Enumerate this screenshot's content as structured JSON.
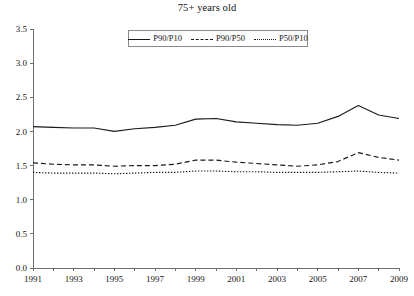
{
  "chart_data": {
    "type": "line",
    "title": "75+ years old",
    "xlabel": "",
    "ylabel": "",
    "xlim": [
      1991,
      2009
    ],
    "ylim": [
      0.0,
      3.5
    ],
    "ytick_labels": [
      "0.0",
      "0.5",
      "1.0",
      "1.5",
      "2.0",
      "2.5",
      "3.0",
      "3.5"
    ],
    "ytick_values": [
      0.0,
      0.5,
      1.0,
      1.5,
      2.0,
      2.5,
      3.0,
      3.5
    ],
    "xtick_labels": [
      "1991",
      "1993",
      "1995",
      "1997",
      "1999",
      "2001",
      "2003",
      "2005",
      "2007",
      "2009"
    ],
    "xtick_values": [
      1991,
      1993,
      1995,
      1997,
      1999,
      2001,
      2003,
      2005,
      2007,
      2009
    ],
    "minor_xtick_values": [
      1992,
      1994,
      1996,
      1998,
      2000,
      2002,
      2004,
      2006,
      2008
    ],
    "grid": false,
    "legend_position": "top-center",
    "x": [
      1991,
      1992,
      1993,
      1994,
      1995,
      1996,
      1997,
      1998,
      1999,
      2000,
      2001,
      2002,
      2003,
      2004,
      2005,
      2006,
      2007,
      2008,
      2009
    ],
    "series": [
      {
        "name": "P90/P10",
        "style": "solid",
        "color": "#1a1a1a",
        "values": [
          2.07,
          2.06,
          2.05,
          2.05,
          2.0,
          2.04,
          2.06,
          2.09,
          2.18,
          2.19,
          2.14,
          2.12,
          2.1,
          2.09,
          2.12,
          2.22,
          2.38,
          2.24,
          2.19
        ]
      },
      {
        "name": "P90/P50",
        "style": "dashed",
        "color": "#1a1a1a",
        "values": [
          1.54,
          1.52,
          1.51,
          1.51,
          1.49,
          1.5,
          1.5,
          1.52,
          1.58,
          1.58,
          1.55,
          1.53,
          1.51,
          1.49,
          1.51,
          1.56,
          1.69,
          1.62,
          1.58
        ]
      },
      {
        "name": "P50/P10",
        "style": "dotted",
        "color": "#1a1a1a",
        "values": [
          1.4,
          1.39,
          1.39,
          1.39,
          1.38,
          1.39,
          1.4,
          1.4,
          1.42,
          1.42,
          1.41,
          1.41,
          1.4,
          1.4,
          1.4,
          1.41,
          1.42,
          1.4,
          1.39
        ]
      }
    ],
    "legend": [
      {
        "label": "P90/P10",
        "style": "solid"
      },
      {
        "label": "P90/P50",
        "style": "dashed"
      },
      {
        "label": "P50/P10",
        "style": "dotted"
      }
    ]
  },
  "plot_geometry": {
    "left": 33,
    "right": 399,
    "top": 29,
    "bottom": 268
  }
}
